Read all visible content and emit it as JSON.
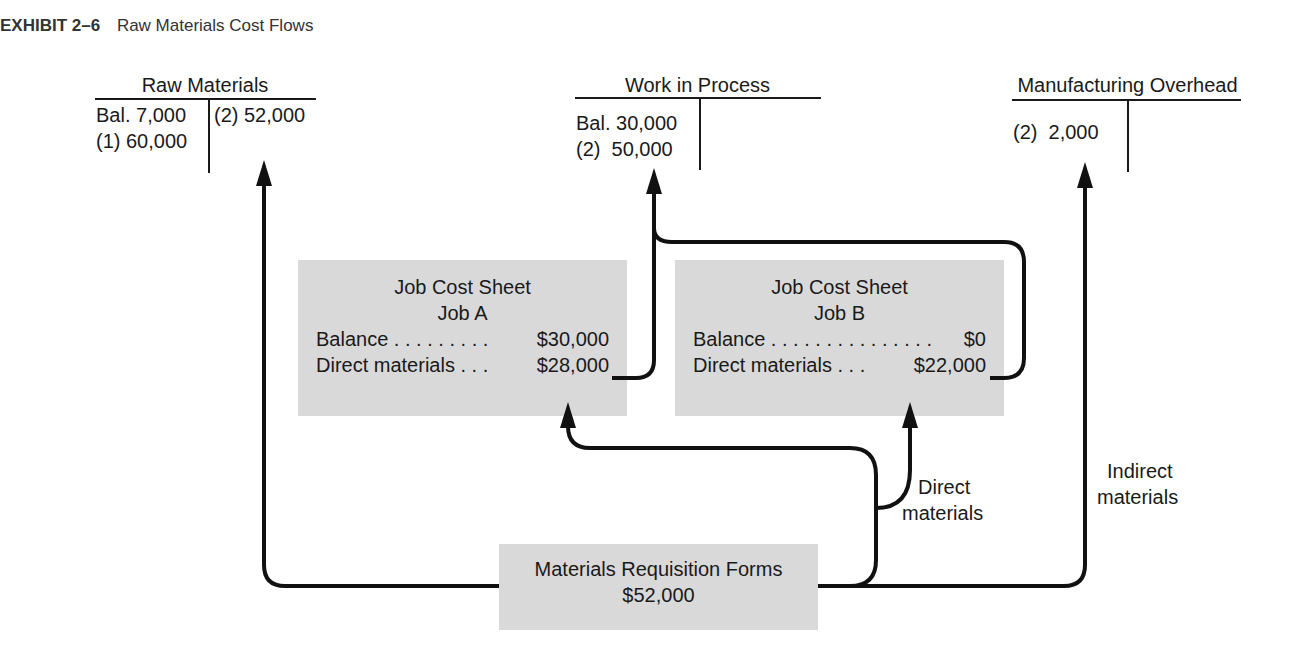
{
  "exhibit": {
    "number": "EXHIBIT 2–6",
    "title": "Raw Materials Cost Flows"
  },
  "accounts": {
    "raw_materials": {
      "title": "Raw Materials",
      "debits": [
        "Bal. 7,000",
        "(1) 60,000"
      ],
      "credits": [
        "(2) 52,000"
      ]
    },
    "work_in_process": {
      "title": "Work in Process",
      "debits": [
        "Bal. 30,000",
        "(2)  50,000"
      ],
      "credits": []
    },
    "manufacturing_overhead": {
      "title": "Manufacturing Overhead",
      "debits": [
        "(2)  2,000"
      ],
      "credits": []
    }
  },
  "job_cost_sheets": [
    {
      "title": "Job Cost Sheet",
      "job": "Job A",
      "rows": [
        {
          "label": "Balance . . . . . . . . .",
          "value": "$30,000"
        },
        {
          "label": "Direct materials . . .",
          "value": "$28,000"
        }
      ]
    },
    {
      "title": "Job Cost Sheet",
      "job": "Job B",
      "rows": [
        {
          "label": "Balance . . . . . . . . . . . . . . .",
          "value": "$0"
        },
        {
          "label": "Direct materials . . .",
          "value": "$22,000"
        }
      ]
    }
  ],
  "requisition": {
    "title": "Materials Requisition Forms",
    "amount": "$52,000"
  },
  "flow_labels": {
    "direct": [
      "Direct",
      "materials"
    ],
    "indirect": [
      "Indirect",
      "materials"
    ]
  },
  "colors": {
    "box_fill": "#d9d9d9",
    "line": "#111111"
  }
}
